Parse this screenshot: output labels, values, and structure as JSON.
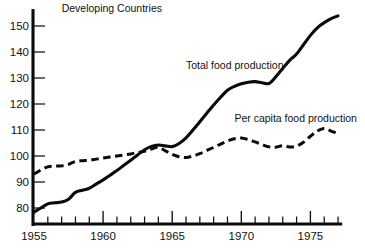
{
  "chart_data": {
    "type": "line",
    "title": "Developing Countries",
    "xlabel": "",
    "ylabel": "",
    "xlim": [
      1955,
      1977.2
    ],
    "ylim": [
      72,
      158
    ],
    "grid": false,
    "legend_position": "inline-annotations",
    "y_ticks": [
      80,
      90,
      100,
      110,
      120,
      130,
      140,
      150
    ],
    "y_tick_labels": [
      "80",
      "90",
      "100",
      "110",
      "120",
      "130",
      "140",
      "150"
    ],
    "x_ticks": [
      1955,
      1956,
      1957,
      1958,
      1959,
      1960,
      1961,
      1962,
      1963,
      1964,
      1965,
      1966,
      1967,
      1968,
      1969,
      1970,
      1971,
      1972,
      1973,
      1974,
      1975,
      1976,
      1977
    ],
    "x_major_ticks": [
      1955,
      1960,
      1965,
      1970,
      1975
    ],
    "x_tick_labels": [
      "1955",
      "1960",
      "1965",
      "1970",
      "1975"
    ],
    "annotations": [
      {
        "text": "Developing Countries",
        "x": 1957.0,
        "y": 155.5
      },
      {
        "text": "Total food production",
        "x": 1966.0,
        "y": 133.5
      },
      {
        "text": "Per capita food production",
        "x": 1969.5,
        "y": 113.0
      }
    ],
    "series": [
      {
        "name": "Total food production",
        "style": "solid",
        "x": [
          1955,
          1955.5,
          1956,
          1956.5,
          1957,
          1957.5,
          1958,
          1958.5,
          1959,
          1959.5,
          1960,
          1960.5,
          1961,
          1961.5,
          1962,
          1962.5,
          1963,
          1963.5,
          1964,
          1964.5,
          1965,
          1965.5,
          1966,
          1966.5,
          1967,
          1967.5,
          1968,
          1968.5,
          1969,
          1969.5,
          1970,
          1970.5,
          1971,
          1971.5,
          1972,
          1972.5,
          1973,
          1973.5,
          1974,
          1974.5,
          1975,
          1975.5,
          1976,
          1976.5,
          1977
        ],
        "y": [
          78.4,
          80.0,
          81.6,
          82.0,
          82.3,
          83.4,
          86.0,
          86.8,
          87.6,
          89.2,
          90.8,
          92.6,
          94.4,
          96.4,
          98.4,
          100.4,
          102.4,
          103.7,
          104.2,
          103.9,
          103.6,
          104.8,
          107.0,
          110.0,
          113.2,
          116.4,
          119.6,
          122.6,
          125.3,
          126.8,
          127.8,
          128.4,
          128.6,
          128.2,
          127.9,
          130.5,
          133.7,
          136.8,
          139.2,
          142.8,
          146.4,
          149.3,
          151.3,
          152.8,
          153.9
        ]
      },
      {
        "name": "Per capita food production",
        "style": "dashed",
        "x": [
          1955,
          1955.5,
          1956,
          1956.5,
          1957,
          1957.5,
          1958,
          1958.5,
          1959,
          1959.5,
          1960,
          1960.5,
          1961,
          1961.5,
          1962,
          1962.5,
          1963,
          1963.5,
          1964,
          1964.5,
          1965,
          1965.5,
          1966,
          1966.5,
          1967,
          1967.5,
          1968,
          1968.5,
          1969,
          1969.5,
          1970,
          1970.5,
          1971,
          1971.5,
          1972,
          1972.5,
          1973,
          1973.5,
          1974,
          1974.5,
          1975,
          1975.5,
          1976,
          1976.5,
          1977
        ],
        "y": [
          93.0,
          94.6,
          95.8,
          96.1,
          96.2,
          96.8,
          97.9,
          98.2,
          98.4,
          98.8,
          99.2,
          99.6,
          100.0,
          100.4,
          100.8,
          101.4,
          101.8,
          102.7,
          103.3,
          102.0,
          100.6,
          99.7,
          99.4,
          100.0,
          100.9,
          102.1,
          103.3,
          104.6,
          105.8,
          106.6,
          106.9,
          106.3,
          105.4,
          104.4,
          103.5,
          103.4,
          104.0,
          103.5,
          103.8,
          105.3,
          107.6,
          109.6,
          110.6,
          109.6,
          108.7
        ]
      }
    ]
  }
}
